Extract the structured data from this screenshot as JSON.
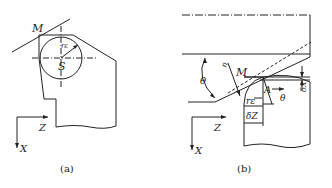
{
  "figure_a": {
    "caption": "(a)",
    "labels": {
      "point_m": "M",
      "center": "S",
      "radius": "rε",
      "axis_z": "Z",
      "axis_x": "X"
    }
  },
  "figure_b": {
    "caption": "(b)",
    "labels": {
      "point_m": "M",
      "point_a": "A",
      "angle": "θ",
      "angle2": "θ",
      "radius": "rε",
      "delta_z": "δZ",
      "delta_x": "δX",
      "normal": "n",
      "axis_z": "Z",
      "axis_x": "X"
    }
  },
  "colors": {
    "line": "#222222",
    "background": "#ffffff"
  }
}
